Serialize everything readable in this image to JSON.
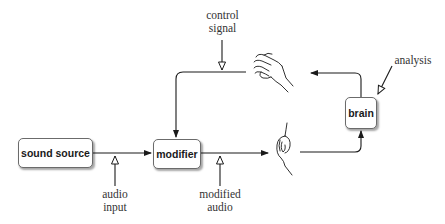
{
  "diagram": {
    "nodes": {
      "sound_source": {
        "label": "sound source"
      },
      "modifier": {
        "label": "modifier"
      },
      "brain": {
        "label": "brain"
      }
    },
    "annotations": {
      "control_signal": {
        "line1": "control",
        "line2": "signal"
      },
      "audio_input": {
        "line1": "audio",
        "line2": "input"
      },
      "modified_audio": {
        "line1": "modified",
        "line2": "audio"
      },
      "analysis": {
        "label": "analysis"
      }
    },
    "icons": {
      "hand": "hand-icon",
      "ear": "ear-icon"
    },
    "edges": [
      {
        "from": "sound source",
        "to": "modifier"
      },
      {
        "from": "modifier",
        "to": "ear"
      },
      {
        "from": "ear",
        "to": "brain"
      },
      {
        "from": "brain",
        "to": "hand"
      },
      {
        "from": "hand",
        "to": "modifier"
      }
    ],
    "colors": {
      "stroke": "#1a1a1a",
      "box_border": "#6b6b6b",
      "text": "#333333"
    }
  }
}
